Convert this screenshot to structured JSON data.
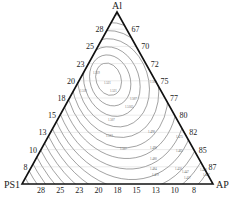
{
  "chart_data": {
    "type": "ternary-contour",
    "title": "",
    "vertices": {
      "top": "Al",
      "left": "PS1",
      "right": "AP"
    },
    "left_axis_ticks": [
      "28",
      "25",
      "23",
      "20",
      "18",
      "15",
      "13",
      "10",
      "8"
    ],
    "right_axis_ticks": [
      "67",
      "70",
      "72",
      "75",
      "77",
      "80",
      "82",
      "85",
      "87"
    ],
    "bottom_axis_ticks": [
      "28",
      "25",
      "23",
      "20",
      "18",
      "15",
      "13",
      "10",
      "8"
    ],
    "contour_center": {
      "x_frac": 0.44,
      "y_frac": 0.44
    },
    "contour_labels": [
      "1.519",
      "1.521",
      "1.521",
      "1.519",
      "1.505",
      "1.507",
      "1.5165",
      "1.507",
      "1.513",
      "1.507",
      "1.498",
      "1.475",
      "1.490",
      "1.465",
      "1.480",
      "1.484",
      "1.450",
      "1.479",
      "1.447",
      "1.420",
      "1.417",
      "1.407"
    ],
    "contour_count": 22,
    "grid": true
  }
}
